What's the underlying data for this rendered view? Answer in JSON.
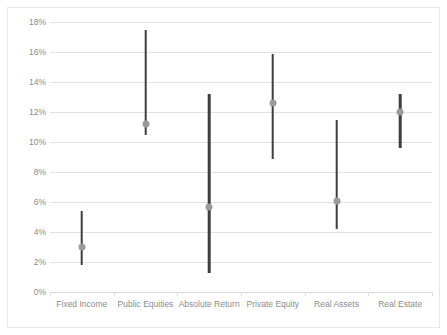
{
  "chart_data": {
    "type": "bar",
    "subtype": "high-low-median range (floating bar) chart",
    "title": "",
    "subtitle": "",
    "xlabel": "",
    "ylabel": "",
    "ylim": [
      0,
      18
    ],
    "y_tick_format": "percent",
    "grid": true,
    "legend": "none",
    "categories": [
      "Fixed Income",
      "Public Equities",
      "Absolute Return",
      "Private Equity",
      "Real Assets",
      "Real Estate"
    ],
    "y_tick_labels": [
      "0%",
      "2%",
      "4%",
      "6%",
      "8%",
      "10%",
      "12%",
      "14%",
      "16%",
      "18%"
    ],
    "y_tick_values": [
      0,
      2,
      4,
      6,
      8,
      10,
      12,
      14,
      16,
      18
    ],
    "series": [
      {
        "name": "High",
        "values": [
          5.4,
          17.5,
          13.2,
          15.9,
          11.5,
          13.2
        ]
      },
      {
        "name": "Low",
        "values": [
          1.8,
          10.5,
          1.3,
          8.9,
          4.2,
          9.6
        ]
      },
      {
        "name": "Midpoint",
        "values": [
          3.0,
          11.2,
          5.7,
          12.6,
          6.1,
          12.0
        ]
      }
    ],
    "points": [
      {
        "category": "Fixed Income",
        "low": 1.8,
        "high": 5.4,
        "mid": 3.0
      },
      {
        "category": "Public Equities",
        "low": 10.5,
        "high": 17.5,
        "mid": 11.2
      },
      {
        "category": "Absolute Return",
        "low": 1.3,
        "high": 13.2,
        "mid": 5.7
      },
      {
        "category": "Private Equity",
        "low": 8.9,
        "high": 15.9,
        "mid": 12.6
      },
      {
        "category": "Real Assets",
        "low": 4.2,
        "high": 11.5,
        "mid": 6.1
      },
      {
        "category": "Real Estate",
        "low": 9.6,
        "high": 13.2,
        "mid": 12.0
      }
    ],
    "colors": {
      "bar": "#3f3f3f",
      "marker": "#9b9b9b",
      "gridline": "#e3e3e3",
      "axis": "#d9d9d9",
      "tick_label": "#8c8c8c",
      "frame": "#e8e8e8",
      "background": "#ffffff"
    }
  }
}
